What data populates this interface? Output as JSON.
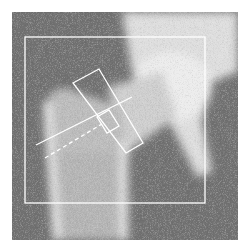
{
  "image": {
    "description": "Dual-energy X-ray absorptiometry (DXA) scan of the proximal femur / hip with analysis regions overlaid",
    "colors": {
      "background": "#ffffff",
      "scan_dark": "#6e6e6e",
      "bone": "#e6e6e6",
      "overlay": "#ffffff"
    },
    "regions": [
      "global-roi",
      "femoral-neck-roi",
      "ward-triangle-roi",
      "femoral-axis-line"
    ]
  }
}
